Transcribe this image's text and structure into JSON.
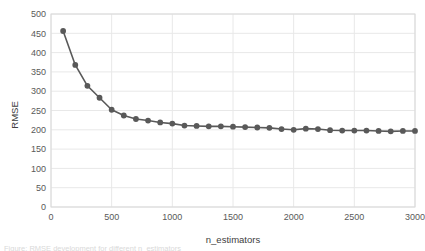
{
  "figure": {
    "background_color": "#ffffff",
    "plot_border_color": "#d9d9d9",
    "gridline_color": "#e8e8e8",
    "series_color": "#595959",
    "tick_label_color": "#595959",
    "axis_title_color": "#404040"
  },
  "caption": {
    "text": "Figure: RMSE development for different n_estimators"
  },
  "chart_data": {
    "type": "line",
    "title": "",
    "xlabel": "n_estimators",
    "ylabel": "RMSE",
    "xlim": [
      0,
      3000
    ],
    "ylim": [
      0,
      500
    ],
    "xticks": [
      0,
      500,
      1000,
      1500,
      2000,
      2500,
      3000
    ],
    "xtick_labels": [
      "0",
      "500",
      "1000",
      "1500",
      "2000",
      "2500",
      "3000"
    ],
    "yticks": [
      0,
      50,
      100,
      150,
      200,
      250,
      300,
      350,
      400,
      450,
      500
    ],
    "ytick_labels": [
      "0",
      "50",
      "100",
      "150",
      "200",
      "250",
      "300",
      "350",
      "400",
      "450",
      "500"
    ],
    "grid": "horizontal-and-vertical",
    "legend": "none",
    "marker": "circle",
    "marker_size": 5,
    "line_width": 1.6,
    "series": [
      {
        "name": "RMSE",
        "color": "#595959",
        "x": [
          100,
          200,
          300,
          400,
          500,
          600,
          700,
          800,
          900,
          1000,
          1100,
          1200,
          1300,
          1400,
          1500,
          1600,
          1700,
          1800,
          1900,
          2000,
          2100,
          2200,
          2300,
          2400,
          2500,
          2600,
          2700,
          2800,
          2900,
          3000
        ],
        "values": [
          456,
          368,
          314,
          283,
          252,
          237,
          228,
          224,
          219,
          216,
          211,
          210,
          209,
          209,
          208,
          207,
          206,
          205,
          202,
          200,
          203,
          202,
          199,
          198,
          198,
          198,
          197,
          196,
          197,
          197
        ]
      }
    ]
  }
}
